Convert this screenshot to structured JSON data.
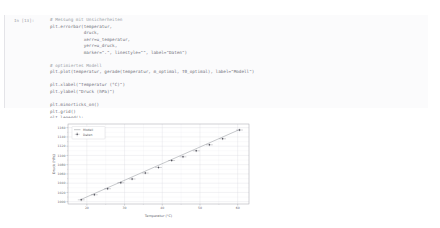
{
  "cell": {
    "prompt": "In [13]:",
    "code_lines": [
      {
        "text": "# Messung mit Unsicherheiten",
        "kind": "comment"
      },
      {
        "text": "plt.errorbar(temperatur,",
        "kind": "code"
      },
      {
        "text": "             druck,",
        "kind": "code"
      },
      {
        "text": "             xerr=u_temperatur,",
        "kind": "code"
      },
      {
        "text": "             yerr=u_druck,",
        "kind": "code"
      },
      {
        "text": "             marker=\".\", linestyle=\"\", label=\"Daten\")",
        "kind": "code"
      },
      {
        "text": "",
        "kind": "blank"
      },
      {
        "text": "# optimiertes Modell",
        "kind": "comment"
      },
      {
        "text": "plt.plot(temperatur, gerade(temperatur, m_optimal, T0_optimal), label=\"Modell\")",
        "kind": "code"
      },
      {
        "text": "",
        "kind": "blank"
      },
      {
        "text": "plt.xlabel(\"Temperatur (°C)\")",
        "kind": "code"
      },
      {
        "text": "plt.ylabel(\"Druck (hPa)\")",
        "kind": "code"
      },
      {
        "text": "",
        "kind": "blank"
      },
      {
        "text": "plt.minorticks_on()",
        "kind": "code"
      },
      {
        "text": "plt.grid()",
        "kind": "code"
      },
      {
        "text": "plt.legend();",
        "kind": "code"
      }
    ]
  },
  "chart_data": {
    "type": "scatter",
    "title": "",
    "xlabel": "Temperatur (°C)",
    "ylabel": "Druck (hPa)",
    "xlim": [
      15,
      63
    ],
    "ylim": [
      995,
      1168
    ],
    "xticks": [
      20,
      30,
      40,
      50,
      60
    ],
    "yticks": [
      1000,
      1020,
      1040,
      1060,
      1080,
      1100,
      1120,
      1140,
      1160
    ],
    "xtick_labels": [
      "20",
      "30",
      "40",
      "50",
      "60"
    ],
    "ytick_labels": [
      "1000",
      "1020",
      "1040",
      "1060",
      "1080",
      "1100",
      "1120",
      "1140",
      "1160"
    ],
    "grid": true,
    "minor_ticks": true,
    "legend_position": "upper left",
    "series": [
      {
        "name": "Modell",
        "type": "line",
        "color": "#8f9298",
        "x": [
          18.5,
          60.5
        ],
        "y": [
          1005.0,
          1156.0
        ]
      },
      {
        "name": "Daten",
        "type": "errorbar",
        "color": "#4c4c56",
        "marker": ".",
        "x": [
          18.5,
          22.0,
          25.5,
          29.0,
          32.0,
          35.5,
          39.0,
          42.5,
          45.5,
          49.0,
          52.5,
          56.0,
          60.5
        ],
        "y": [
          1004.0,
          1015.0,
          1028.0,
          1041.0,
          1049.0,
          1062.0,
          1074.0,
          1089.0,
          1097.0,
          1110.0,
          1123.0,
          1136.0,
          1155.0
        ],
        "xerr": [
          0.9,
          0.9,
          0.9,
          0.9,
          0.9,
          0.9,
          0.9,
          0.9,
          0.9,
          0.9,
          0.9,
          0.9,
          0.9
        ],
        "yerr": [
          3.0,
          3.0,
          3.0,
          3.0,
          3.0,
          3.0,
          3.0,
          3.0,
          3.0,
          3.0,
          3.0,
          3.0,
          3.0
        ]
      }
    ]
  }
}
